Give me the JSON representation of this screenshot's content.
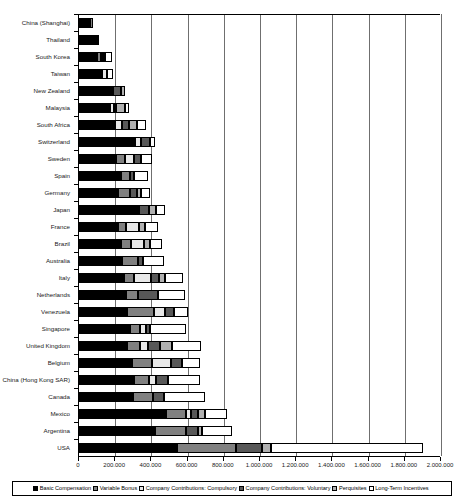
{
  "chart_data": {
    "type": "bar",
    "orientation": "horizontal",
    "stacked": true,
    "title": "",
    "xlabel": "",
    "ylabel": "",
    "xlim": [
      0,
      2000000
    ],
    "grid": true,
    "legend_position": "bottom",
    "xticks": [
      0,
      200000,
      400000,
      600000,
      800000,
      1000000,
      1200000,
      1400000,
      1600000,
      1800000,
      2000000
    ],
    "xtick_labels": [
      "0",
      "200.000",
      "400.000",
      "600.000",
      "800.000",
      "1.000.000",
      "1.200.000",
      "1.400.000",
      "1.600.000",
      "1.800.000",
      "2.000.000"
    ],
    "series": [
      {
        "name": "Basic Compensation",
        "color": "#000000"
      },
      {
        "name": "Variable Bonus",
        "color": "#808080"
      },
      {
        "name": "Company Contributions: Compulsory",
        "color": "#e8e8e8"
      },
      {
        "name": "Company Contributions: Voluntary",
        "color": "#585858"
      },
      {
        "name": "Perquisites",
        "color": "#b0b0b0"
      },
      {
        "name": "Long-Term Incentives",
        "color": "#ffffff"
      }
    ],
    "categories": [
      "China (Shanghai)",
      "Thailand",
      "South Korea",
      "Taiwan",
      "New Zealand",
      "Malaysia",
      "South Africa",
      "Switzerland",
      "Sweden",
      "Spain",
      "Germany",
      "Japan",
      "France",
      "Brazil",
      "Australia",
      "Italy",
      "Netherlands",
      "Venezuela",
      "Singapore",
      "United Kingdom",
      "Belgium",
      "China (Hong Kong SAR)",
      "Canada",
      "Mexico",
      "Argentina",
      "USA"
    ],
    "values": [
      [
        62000,
        14000,
        0,
        0,
        0,
        0
      ],
      [
        86000,
        0,
        4000,
        14000,
        0,
        0
      ],
      [
        100000,
        22000,
        8000,
        10000,
        0,
        37000
      ],
      [
        128000,
        0,
        26000,
        0,
        0,
        32000
      ],
      [
        186000,
        0,
        0,
        48000,
        18000,
        0
      ],
      [
        170000,
        0,
        22000,
        12000,
        52000,
        20000
      ],
      [
        198000,
        0,
        42000,
        38000,
        40000,
        54000
      ],
      [
        312000,
        0,
        28000,
        52000,
        0,
        28000
      ],
      [
        206000,
        50000,
        50000,
        34000,
        0,
        66000
      ],
      [
        230000,
        54000,
        0,
        18000,
        0,
        78000
      ],
      [
        218000,
        66000,
        0,
        38000,
        18000,
        54000
      ],
      [
        320000,
        0,
        14000,
        52000,
        40000,
        52000
      ],
      [
        216000,
        46000,
        68000,
        0,
        34000,
        70000
      ],
      [
        230000,
        60000,
        68000,
        0,
        36000,
        66000
      ],
      [
        240000,
        88000,
        0,
        26000,
        0,
        114000
      ],
      [
        248000,
        56000,
        94000,
        42000,
        34000,
        100000
      ],
      [
        262000,
        66000,
        0,
        110000,
        0,
        150000
      ],
      [
        266000,
        146000,
        62000,
        50000,
        0,
        76000
      ],
      [
        280000,
        56000,
        36000,
        18000,
        0,
        204000
      ],
      [
        266000,
        72000,
        46000,
        66000,
        66000,
        160000
      ],
      [
        292000,
        112000,
        106000,
        60000,
        0,
        96000
      ],
      [
        304000,
        82000,
        40000,
        66000,
        0,
        178000
      ],
      [
        300000,
        110000,
        0,
        58000,
        0,
        228000
      ],
      [
        480000,
        110000,
        30000,
        40000,
        36000,
        120000
      ],
      [
        420000,
        170000,
        0,
        66000,
        26000,
        162000
      ],
      [
        540000,
        330000,
        0,
        140000,
        50000,
        840000
      ]
    ]
  },
  "legend": {
    "items": [
      {
        "label": "Basic Compensation"
      },
      {
        "label": "Variable Bonus"
      },
      {
        "label": "Company Contributions: Compulsory"
      },
      {
        "label": "Company Contributions: Voluntary"
      },
      {
        "label": "Perquisites"
      },
      {
        "label": "Long-Term Incentives"
      }
    ]
  }
}
